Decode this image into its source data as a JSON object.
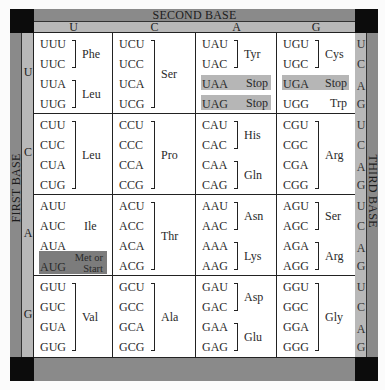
{
  "titles": {
    "second_base": "SECOND BASE",
    "first_base": "FIRST BASE",
    "third_base": "THIRD BASE"
  },
  "second_base_letters": [
    "U",
    "C",
    "A",
    "G"
  ],
  "first_base_letters": [
    "U",
    "C",
    "A",
    "G"
  ],
  "third_base_letters": [
    "U",
    "C",
    "A",
    "G",
    "U",
    "C",
    "A",
    "G",
    "U",
    "C",
    "A",
    "G",
    "U",
    "C",
    "A",
    "G"
  ],
  "cells": {
    "UU": {
      "codons": [
        "UUU",
        "UUC",
        "UUA",
        "UUG"
      ],
      "groups": [
        {
          "label": "Phe",
          "rows": [
            0,
            1
          ]
        },
        {
          "label": "Leu",
          "rows": [
            2,
            3
          ]
        }
      ]
    },
    "UC": {
      "codons": [
        "UCU",
        "UCC",
        "UCA",
        "UCG"
      ],
      "groups": [
        {
          "label": "Ser",
          "rows": [
            0,
            3
          ]
        }
      ]
    },
    "UA": {
      "codons": [
        "UAU",
        "UAC",
        "UAA",
        "UAG"
      ],
      "groups": [
        {
          "label": "Tyr",
          "rows": [
            0,
            1
          ]
        }
      ],
      "stops": [
        {
          "codon_row": 2,
          "label": "Stop"
        },
        {
          "codon_row": 3,
          "label": "Stop"
        }
      ]
    },
    "UG": {
      "codons": [
        "UGU",
        "UGC",
        "UGA",
        "UGG"
      ],
      "groups": [
        {
          "label": "Cys",
          "rows": [
            0,
            1
          ]
        }
      ],
      "stops": [
        {
          "codon_row": 2,
          "label": "Stop"
        }
      ],
      "single": [
        {
          "codon_row": 3,
          "label": "Trp"
        }
      ]
    },
    "CU": {
      "codons": [
        "CUU",
        "CUC",
        "CUA",
        "CUG"
      ],
      "groups": [
        {
          "label": "Leu",
          "rows": [
            0,
            3
          ]
        }
      ]
    },
    "CC": {
      "codons": [
        "CCU",
        "CCC",
        "CCA",
        "CCG"
      ],
      "groups": [
        {
          "label": "Pro",
          "rows": [
            0,
            3
          ]
        }
      ]
    },
    "CA": {
      "codons": [
        "CAU",
        "CAC",
        "CAA",
        "CAG"
      ],
      "groups": [
        {
          "label": "His",
          "rows": [
            0,
            1
          ]
        },
        {
          "label": "Gln",
          "rows": [
            2,
            3
          ]
        }
      ]
    },
    "CG": {
      "codons": [
        "CGU",
        "CGC",
        "CGA",
        "CGG"
      ],
      "groups": [
        {
          "label": "Arg",
          "rows": [
            0,
            3
          ]
        }
      ]
    },
    "AU": {
      "codons": [
        "AUU",
        "AUC",
        "AUA",
        "AUG"
      ],
      "unbracketed": [
        {
          "label": "Ile",
          "rows": [
            0,
            2
          ]
        }
      ],
      "start": {
        "codon_row": 3,
        "label_line1": "Met or",
        "label_line2": "Start"
      }
    },
    "AC": {
      "codons": [
        "ACU",
        "ACC",
        "ACA",
        "ACG"
      ],
      "groups": [
        {
          "label": "Thr",
          "rows": [
            0,
            3
          ]
        }
      ]
    },
    "AA": {
      "codons": [
        "AAU",
        "AAC",
        "AAA",
        "AAG"
      ],
      "groups": [
        {
          "label": "Asn",
          "rows": [
            0,
            1
          ]
        },
        {
          "label": "Lys",
          "rows": [
            2,
            3
          ]
        }
      ]
    },
    "AG": {
      "codons": [
        "AGU",
        "AGC",
        "AGA",
        "AGG"
      ],
      "groups": [
        {
          "label": "Ser",
          "rows": [
            0,
            1
          ]
        },
        {
          "label": "Arg",
          "rows": [
            2,
            3
          ]
        }
      ]
    },
    "GU": {
      "codons": [
        "GUU",
        "GUC",
        "GUA",
        "GUG"
      ],
      "groups": [
        {
          "label": "Val",
          "rows": [
            0,
            3
          ]
        }
      ]
    },
    "GC": {
      "codons": [
        "GCU",
        "GCC",
        "GCA",
        "GCG"
      ],
      "groups": [
        {
          "label": "Ala",
          "rows": [
            0,
            3
          ]
        }
      ]
    },
    "GA": {
      "codons": [
        "GAU",
        "GAC",
        "GAA",
        "GAG"
      ],
      "groups": [
        {
          "label": "Asp",
          "rows": [
            0,
            1
          ]
        },
        {
          "label": "Glu",
          "rows": [
            2,
            3
          ]
        }
      ]
    },
    "GG": {
      "codons": [
        "GGU",
        "GGC",
        "GGA",
        "GGG"
      ],
      "groups": [
        {
          "label": "Gly",
          "rows": [
            0,
            3
          ]
        }
      ]
    }
  },
  "colors": {
    "corner": "#0c0c0c",
    "bar_dark": "#8a8a8a",
    "bar_light": "#b8b8b8",
    "stop_highlight": "#b6b6b6",
    "start_highlight": "#7c7c7c"
  }
}
